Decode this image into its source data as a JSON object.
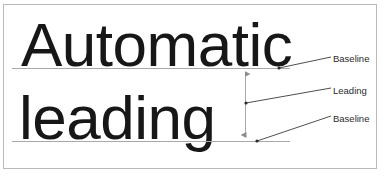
{
  "figure": {
    "background_color": "#ffffff",
    "frame_color": "#b9b9b9",
    "text_color": "#171717",
    "rule_color": "#a8a8a8",
    "leader_color": "#3a3a3a"
  },
  "sample_text": {
    "line1": "Automatic",
    "line2": "leading"
  },
  "labels": {
    "baseline_top": "Baseline",
    "leading": "Leading",
    "baseline_bottom": "Baseline"
  },
  "guides": {
    "baseline_top_y": 68,
    "baseline_bottom_y": 141,
    "baseline_x_start": 12,
    "baseline_x_end": 290,
    "dimension_line_x": 245,
    "leading_distance_px": 73
  }
}
